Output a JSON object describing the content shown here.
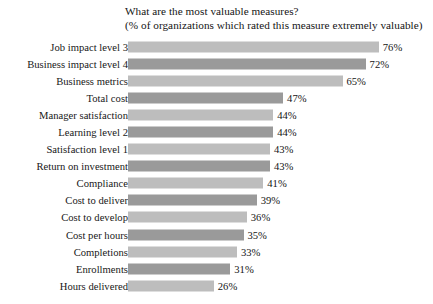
{
  "chart_data": {
    "type": "bar",
    "orientation": "horizontal",
    "title": "What are the most valuable measures?",
    "subtitle": "(% of organizations which rated this measure extremely valuable)",
    "xlabel": "",
    "ylabel": "",
    "xlim": [
      0,
      80
    ],
    "grid": false,
    "legend": "none",
    "value_suffix": "%",
    "categories": [
      "Job impact level 3",
      "Business impact level 4",
      "Business metrics",
      "Total cost",
      "Manager satisfaction",
      "Learning level 2",
      "Satisfaction level 1",
      "Return on investment",
      "Compliance",
      "Cost to deliver",
      "Cost to develop",
      "Cost per hours",
      "Completions",
      "Enrollments",
      "Hours delivered"
    ],
    "values": [
      76,
      72,
      65,
      47,
      44,
      44,
      43,
      43,
      41,
      39,
      36,
      35,
      33,
      31,
      26
    ],
    "value_labels": [
      "76%",
      "72%",
      "65%",
      "47%",
      "44%",
      "44%",
      "43%",
      "43%",
      "41%",
      "39%",
      "36%",
      "35%",
      "33%",
      "31%",
      "26%"
    ],
    "bar_colors": [
      "#bdbdbd",
      "#9a9a9a",
      "#bdbdbd",
      "#9a9a9a",
      "#bdbdbd",
      "#9a9a9a",
      "#bdbdbd",
      "#9a9a9a",
      "#bdbdbd",
      "#9a9a9a",
      "#bdbdbd",
      "#9a9a9a",
      "#bdbdbd",
      "#9a9a9a",
      "#bdbdbd"
    ],
    "palette": {
      "light": "#bdbdbd",
      "dark": "#9a9a9a",
      "text": "#141414",
      "background": "#ffffff"
    }
  }
}
